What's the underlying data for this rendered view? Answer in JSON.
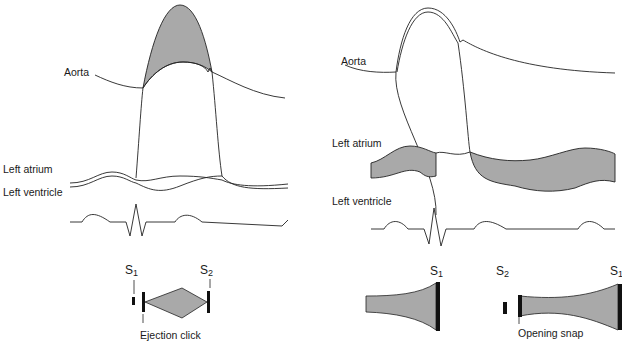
{
  "colors": {
    "line": "#222222",
    "fill": "#a9a9a9",
    "bar": "#111111"
  },
  "left_panel": {
    "labels": {
      "aorta": "Aorta",
      "left_atrium": "Left atrium",
      "left_ventricle": "Left ventricle"
    },
    "sounds": {
      "s1": "S",
      "s1_sub": "1",
      "s2": "S",
      "s2_sub": "2"
    },
    "annotation": "Ejection click"
  },
  "right_panel": {
    "labels": {
      "aorta": "Aorta",
      "left_atrium": "Left atrium",
      "left_ventricle": "Left ventricle"
    },
    "sounds": {
      "s1_a": "S",
      "s1_a_sub": "1",
      "s2": "S",
      "s2_sub": "2",
      "s1_b": "S",
      "s1_b_sub": "1"
    },
    "annotation": "Opening snap"
  }
}
